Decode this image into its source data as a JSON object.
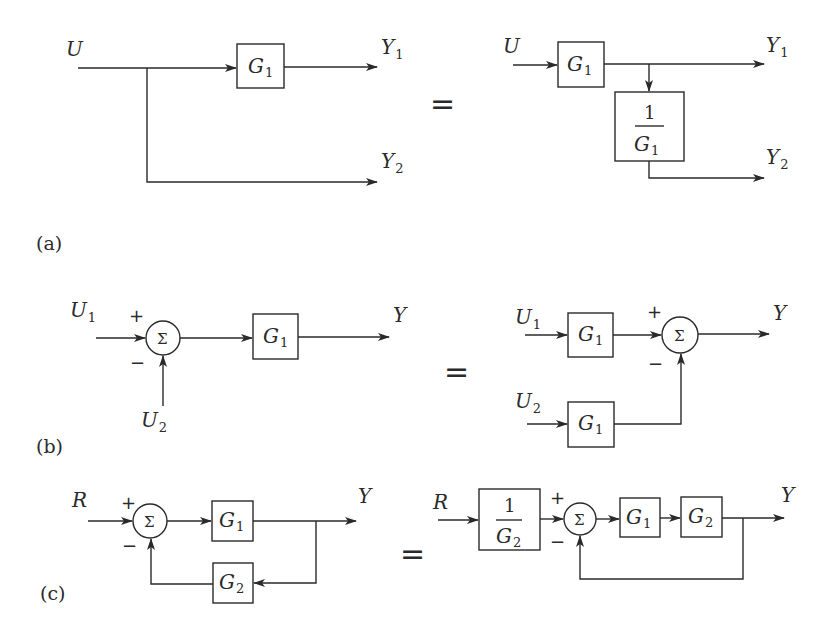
{
  "figure": {
    "panels": [
      {
        "id": "a",
        "label": "(a)",
        "equals": "=",
        "left": {
          "input": {
            "sym": "U",
            "sub": ""
          },
          "blocks": [
            {
              "sym": "G",
              "sub": "1"
            }
          ],
          "outputs": [
            {
              "sym": "Y",
              "sub": "1"
            },
            {
              "sym": "Y",
              "sub": "2"
            }
          ]
        },
        "right": {
          "input": {
            "sym": "U",
            "sub": ""
          },
          "blocks": [
            {
              "sym": "G",
              "sub": "1"
            },
            {
              "num": "1",
              "sym": "G",
              "sub": "1"
            }
          ],
          "outputs": [
            {
              "sym": "Y",
              "sub": "1"
            },
            {
              "sym": "Y",
              "sub": "2"
            }
          ]
        }
      },
      {
        "id": "b",
        "label": "(b)",
        "equals": "=",
        "left": {
          "inputs": [
            {
              "sym": "U",
              "sub": "1"
            },
            {
              "sym": "U",
              "sub": "2"
            }
          ],
          "summer": {
            "glyph": "Σ",
            "plus": "+",
            "minus": "−"
          },
          "blocks": [
            {
              "sym": "G",
              "sub": "1"
            }
          ],
          "output": {
            "sym": "Y",
            "sub": ""
          }
        },
        "right": {
          "inputs": [
            {
              "sym": "U",
              "sub": "1"
            },
            {
              "sym": "U",
              "sub": "2"
            }
          ],
          "summer": {
            "glyph": "Σ",
            "plus": "+",
            "minus": "−"
          },
          "blocks": [
            {
              "sym": "G",
              "sub": "1"
            },
            {
              "sym": "G",
              "sub": "1"
            }
          ],
          "output": {
            "sym": "Y",
            "sub": ""
          }
        }
      },
      {
        "id": "c",
        "label": "(c)",
        "equals": "=",
        "left": {
          "input": {
            "sym": "R",
            "sub": ""
          },
          "summer": {
            "glyph": "Σ",
            "plus": "+",
            "minus": "−"
          },
          "blocks": [
            {
              "sym": "G",
              "sub": "1"
            },
            {
              "sym": "G",
              "sub": "2"
            }
          ],
          "output": {
            "sym": "Y",
            "sub": ""
          }
        },
        "right": {
          "input": {
            "sym": "R",
            "sub": ""
          },
          "summer": {
            "glyph": "Σ",
            "plus": "+",
            "minus": "−"
          },
          "blocks": [
            {
              "num": "1",
              "sym": "G",
              "sub": "2"
            },
            {
              "sym": "G",
              "sub": "1"
            },
            {
              "sym": "G",
              "sub": "2"
            }
          ],
          "output": {
            "sym": "Y",
            "sub": ""
          }
        }
      }
    ]
  }
}
